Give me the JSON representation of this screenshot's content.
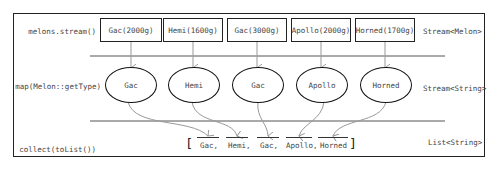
{
  "stages": [
    {
      "operation": "melons.stream()",
      "type": "Stream<Melon>"
    },
    {
      "operation": "map(Melon::getType)",
      "type": "Stream<String>"
    },
    {
      "operation": "collect(toList())",
      "type": "List<String>"
    }
  ],
  "source_elements": [
    "Gac(2000g)",
    "Hemi(1600g)",
    "Gac(3000g)",
    "Apollo(2000g)",
    "Horned(1700g)"
  ],
  "mapped_elements": [
    "Gac",
    "Hemi",
    "Gac",
    "Apollo",
    "Horned"
  ],
  "result_list": {
    "open_bracket": "[",
    "items": [
      "Gac,",
      "Hemi,",
      "Gac,",
      "Apollo,",
      "Horned"
    ],
    "close_bracket": "]"
  }
}
